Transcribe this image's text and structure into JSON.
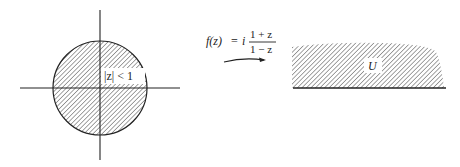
{
  "diagram": {
    "domain_label": "|z| < 1",
    "mapping": {
      "function_name": "f(z)",
      "equals": "=",
      "coefficient": "i",
      "numerator": "1 + z",
      "denominator": "1 − z"
    },
    "codomain_label": "U"
  },
  "colors": {
    "ink": "#222222",
    "background": "#ffffff"
  }
}
